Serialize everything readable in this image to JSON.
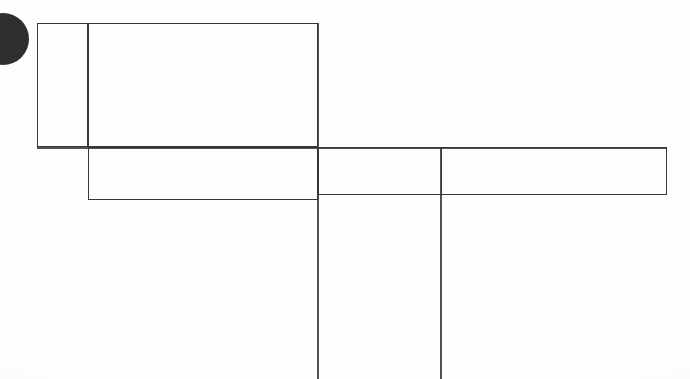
{
  "document": {
    "title": "Scanned Line Drawing Fragment",
    "background_color": "#fefefe",
    "ink_color": "#35363a",
    "mark_color": "#2e2f31",
    "width": 690,
    "height": 379
  },
  "marks": {
    "punch_mark": {
      "label": "punch-mark",
      "shape": "circle",
      "cx": 3,
      "cy": 39,
      "r": 26,
      "color": "#2e2f31"
    }
  },
  "shapes": [
    {
      "label": "upper-left-small-rectangle",
      "type": "rect",
      "x": 37,
      "y": 23,
      "w": 51,
      "h": 124
    },
    {
      "label": "upper-large-rectangle",
      "type": "rect",
      "x": 88,
      "y": 23,
      "w": 230,
      "h": 124
    },
    {
      "label": "middle-left-band-rectangle",
      "type": "rect",
      "x": 88,
      "y": 147,
      "w": 230,
      "h": 53
    },
    {
      "label": "middle-center-band-rectangle",
      "type": "rect",
      "x": 318,
      "y": 147,
      "w": 124,
      "h": 48
    },
    {
      "label": "middle-right-band-rectangle",
      "type": "rect",
      "x": 441,
      "y": 147,
      "w": 226,
      "h": 48
    }
  ],
  "strokes": [
    {
      "label": "long-vertical-stroke-left",
      "type": "vline",
      "x": 317,
      "y_start": 23,
      "y_end": 379
    },
    {
      "label": "long-vertical-stroke-right",
      "type": "vline",
      "x": 440,
      "y_start": 147,
      "y_end": 379
    },
    {
      "label": "horizontal-stroke-band-top",
      "type": "hline",
      "y": 147,
      "x_start": 37,
      "x_end": 667
    }
  ]
}
